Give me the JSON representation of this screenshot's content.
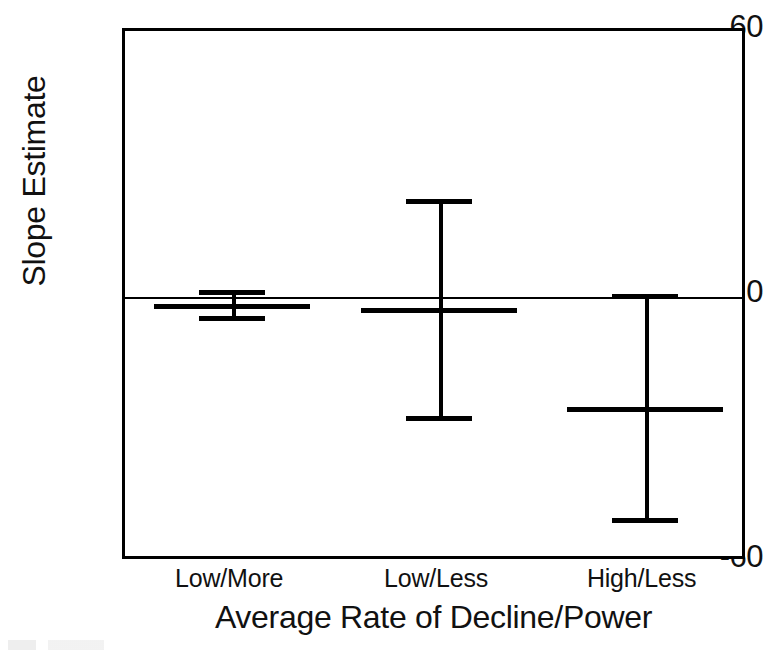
{
  "chart_data": {
    "type": "bar",
    "subtype": "error-bar-point-estimate",
    "title": "",
    "xlabel": "Average Rate of Decline/Power",
    "ylabel": "Slope Estimate",
    "categories": [
      "Low/More",
      "Low/Less",
      "High/Less"
    ],
    "values": [
      -1.6,
      -2.5,
      -25.0
    ],
    "error_upper": [
      1.4,
      22.0,
      0.5
    ],
    "error_lower": [
      -4.5,
      -27.0,
      -50.0
    ],
    "series": [
      {
        "name": "Slope Estimate",
        "points": [
          {
            "category": "Low/More",
            "estimate": -1.6,
            "ci_upper": 1.4,
            "ci_lower": -4.5
          },
          {
            "category": "Low/Less",
            "estimate": -2.5,
            "ci_upper": 22.0,
            "ci_lower": -27.0
          },
          {
            "category": "High/Less",
            "estimate": -25.0,
            "ci_upper": 0.5,
            "ci_lower": -50.0
          }
        ]
      }
    ],
    "ylim": [
      -60,
      60
    ],
    "yticks": [
      60,
      0,
      -60
    ],
    "ytick_labels": [
      "60",
      "0",
      "-60"
    ],
    "xtick_labels": [
      "Low/More",
      "Low/Less",
      "High/Less"
    ],
    "grid": false,
    "legend": null,
    "legend_position": "none",
    "zero_reference_line": 0,
    "colors": {
      "line": "#000000",
      "text": "#111111",
      "background": "#ffffff"
    }
  },
  "axes": {
    "y": {
      "title": "Slope Estimate",
      "tick_top": "60",
      "tick_zero": "0",
      "tick_bottom": "-60"
    },
    "x": {
      "title": "Average Rate of Decline/Power",
      "tick_1": "Low/More",
      "tick_2": "Low/Less",
      "tick_3": "High/Less"
    }
  }
}
